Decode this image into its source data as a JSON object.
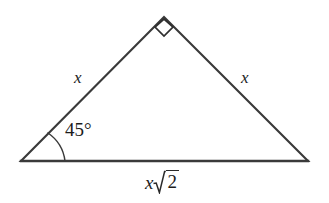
{
  "figure": {
    "kind": "geometry-diagram",
    "shape_name": "isosceles-right-triangle",
    "background_color": "#ffffff",
    "stroke_color": "#3a3a3a",
    "text_color": "#1c1c1c",
    "vertices": {
      "apex": {
        "x": 164,
        "y": 17
      },
      "bottom_left": {
        "x": 21,
        "y": 161
      },
      "bottom_right": {
        "x": 308,
        "y": 161
      }
    },
    "right_angle_marker": {
      "at_vertex": "apex",
      "style": "square",
      "points": "164,19 155,27 164,36 173,27"
    },
    "angle_arc": {
      "at_vertex": "bottom_left",
      "path": "M 48,133 A 40,40 0 0 1 65,161"
    }
  },
  "labels": {
    "leg_left": "x",
    "leg_right": "x",
    "angle": "45°",
    "angle_value": 45,
    "angle_unit": "degrees",
    "hypotenuse_coefficient": "x",
    "hypotenuse_radicand": "2",
    "hypotenuse_full": "x√2"
  }
}
